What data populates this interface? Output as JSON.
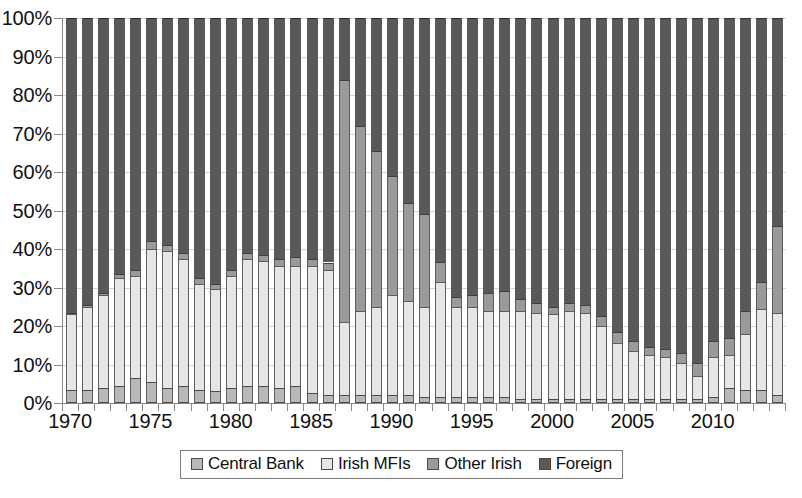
{
  "chart_data": {
    "type": "bar",
    "stacked": true,
    "stack_mode": "percent",
    "title": "",
    "subtitle": "",
    "xlabel": "",
    "ylabel": "",
    "ylim": [
      0,
      100
    ],
    "ytick_labels": [
      "0%",
      "10%",
      "20%",
      "30%",
      "40%",
      "50%",
      "60%",
      "70%",
      "80%",
      "90%",
      "100%"
    ],
    "ytick_values": [
      0,
      10,
      20,
      30,
      40,
      50,
      60,
      70,
      80,
      90,
      100
    ],
    "xtick_labels": [
      "1970",
      "1975",
      "1980",
      "1985",
      "1990",
      "1995",
      "2000",
      "2005",
      "2010"
    ],
    "xtick_values": [
      1970,
      1975,
      1980,
      1985,
      1990,
      1995,
      2000,
      2005,
      2010
    ],
    "grid": true,
    "legend_position": "bottom",
    "legend_entries": [
      "Central Bank",
      "Irish MFIs",
      "Other Irish",
      "Foreign"
    ],
    "series_colors": [
      "#b8b8b8",
      "#e6e6e6",
      "#9a9a9a",
      "#595959"
    ],
    "categories": [
      1970,
      1971,
      1972,
      1973,
      1974,
      1975,
      1976,
      1977,
      1978,
      1979,
      1980,
      1981,
      1982,
      1983,
      1984,
      1985,
      1986,
      1987,
      1988,
      1989,
      1990,
      1991,
      1992,
      1993,
      1994,
      1995,
      1996,
      1997,
      1998,
      1999,
      2000,
      2001,
      2002,
      2003,
      2004,
      2005,
      2006,
      2007,
      2008,
      2009,
      2010,
      2011,
      2012,
      2013,
      2014
    ],
    "series": [
      {
        "name": "Central Bank",
        "color": "#b8b8b8",
        "values": [
          3.5,
          3.5,
          4.0,
          4.5,
          6.5,
          5.5,
          4.0,
          4.5,
          3.5,
          3.0,
          4.0,
          4.5,
          4.5,
          4.0,
          4.5,
          2.5,
          2.0,
          2.0,
          2.0,
          2.0,
          2.0,
          2.0,
          1.5,
          1.5,
          1.5,
          1.5,
          1.5,
          1.5,
          1.0,
          1.0,
          1.0,
          1.0,
          1.0,
          1.0,
          1.0,
          1.0,
          1.0,
          1.0,
          1.0,
          1.0,
          1.5,
          4.0,
          3.5,
          3.5,
          2.0
        ]
      },
      {
        "name": "Irish MFIs",
        "color": "#e6e6e6",
        "values": [
          19.5,
          21.5,
          24.0,
          28.0,
          26.5,
          34.5,
          35.5,
          33.0,
          27.5,
          26.5,
          29.0,
          33.0,
          32.5,
          31.5,
          31.0,
          33.0,
          32.5,
          19.0,
          22.0,
          23.0,
          26.0,
          24.5,
          23.5,
          30.0,
          23.5,
          23.5,
          22.5,
          22.5,
          23.0,
          22.5,
          22.0,
          23.0,
          22.5,
          19.0,
          14.5,
          12.5,
          11.5,
          11.0,
          9.5,
          6.0,
          10.5,
          8.5,
          14.5,
          21.0,
          21.5
        ]
      },
      {
        "name": "Other Irish",
        "color": "#9a9a9a",
        "values": [
          0.5,
          0.5,
          0.5,
          1.0,
          1.5,
          2.0,
          1.5,
          1.5,
          1.5,
          1.5,
          1.5,
          1.5,
          1.5,
          2.0,
          2.5,
          2.0,
          2.0,
          63.0,
          48.0,
          40.5,
          31.0,
          25.5,
          24.0,
          5.0,
          2.5,
          3.0,
          4.5,
          5.0,
          3.0,
          2.5,
          2.0,
          2.0,
          2.0,
          2.5,
          3.0,
          2.5,
          2.0,
          2.0,
          2.5,
          3.5,
          4.0,
          4.5,
          6.0,
          7.0,
          22.5
        ]
      },
      {
        "name": "Foreign",
        "color": "#595959",
        "values": [
          76.5,
          74.5,
          71.5,
          66.5,
          65.5,
          58.0,
          59.0,
          61.0,
          67.5,
          69.0,
          65.5,
          61.0,
          61.5,
          62.5,
          62.0,
          62.5,
          63.5,
          16.0,
          28.0,
          34.5,
          41.0,
          48.0,
          51.0,
          63.5,
          72.5,
          72.0,
          71.5,
          71.0,
          73.0,
          74.0,
          75.0,
          74.0,
          74.5,
          77.5,
          81.5,
          84.0,
          85.5,
          86.0,
          87.0,
          89.5,
          84.0,
          83.0,
          76.0,
          68.5,
          54.0
        ]
      }
    ]
  },
  "legend": {
    "items": [
      {
        "label": "Central Bank",
        "swatch_class": "cb",
        "icon": "legend-swatch-icon"
      },
      {
        "label": "Irish MFIs",
        "swatch_class": "mfi",
        "icon": "legend-swatch-icon"
      },
      {
        "label": "Other Irish",
        "swatch_class": "other",
        "icon": "legend-swatch-icon"
      },
      {
        "label": "Foreign",
        "swatch_class": "foreign",
        "icon": "legend-swatch-icon"
      }
    ]
  }
}
